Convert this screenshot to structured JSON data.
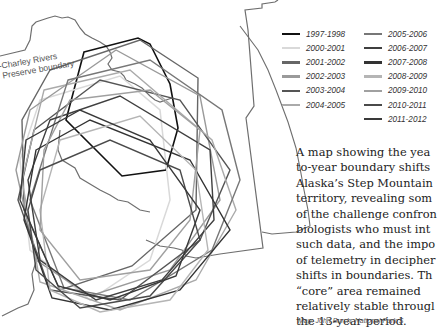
{
  "map": {
    "preserve_label_line1": "-Charley Rivers",
    "preserve_label_line2": "Preserve boundary",
    "preserve_boundary_color": "#6e6e6e"
  },
  "legend": {
    "items": [
      {
        "label": "1997-1998",
        "color": "#111111"
      },
      {
        "label": "2000-2001",
        "color": "#d9d9d9"
      },
      {
        "label": "2001-2002",
        "color": "#666666"
      },
      {
        "label": "2002-2003",
        "color": "#9a9a9a"
      },
      {
        "label": "2003-2004",
        "color": "#555555"
      },
      {
        "label": "2004-2005",
        "color": "#aaaaaa"
      },
      {
        "label": "2005-2006",
        "color": "#777777"
      },
      {
        "label": "2006-2007",
        "color": "#3f3f3f"
      },
      {
        "label": "2007-2008",
        "color": "#333333"
      },
      {
        "label": "2008-2009",
        "color": "#b5b5b5"
      },
      {
        "label": "2009-2010",
        "color": "#a0a0a0"
      },
      {
        "label": "2010-2011",
        "color": "#4a4a4a"
      },
      {
        "label": "2011-2012",
        "color": "#393939"
      }
    ]
  },
  "caption": {
    "lines": [
      "A map showing the yea",
      "to-year boundary shifts",
      "Alaska’s Step Mountain",
      "territory, revealing som",
      "of the challenge confron",
      "biologists who must int",
      "such data, and the impo",
      "of telemetry in decipher",
      "shifts in boundaries. Th",
      "“core” area remained",
      "relatively stable througl",
      "the 13-year period."
    ],
    "credit": "Map: John Burch, National Park S"
  }
}
